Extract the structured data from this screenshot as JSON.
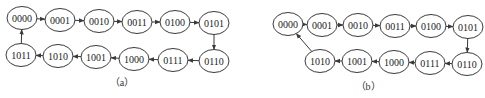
{
  "diagrams": [
    {
      "id": "a",
      "caption": "（a）",
      "caption_pos": [
        122,
        86
      ],
      "nodes": [
        {
          "label": "0000",
          "x": 22,
          "y": 18
        },
        {
          "label": "0001",
          "x": 60,
          "y": 20
        },
        {
          "label": "0010",
          "x": 99,
          "y": 21
        },
        {
          "label": "0011",
          "x": 137,
          "y": 22
        },
        {
          "label": "0100",
          "x": 175,
          "y": 22
        },
        {
          "label": "0101",
          "x": 214,
          "y": 23
        },
        {
          "label": "0110",
          "x": 214,
          "y": 61
        },
        {
          "label": "0111",
          "x": 173,
          "y": 60
        },
        {
          "label": "1000",
          "x": 134,
          "y": 59
        },
        {
          "label": "1001",
          "x": 96,
          "y": 57
        },
        {
          "label": "1010",
          "x": 58,
          "y": 56
        },
        {
          "label": "1011",
          "x": 21,
          "y": 55
        }
      ],
      "edges": [
        [
          0,
          1
        ],
        [
          1,
          2
        ],
        [
          2,
          3
        ],
        [
          3,
          4
        ],
        [
          4,
          5
        ],
        [
          5,
          6
        ],
        [
          6,
          7
        ],
        [
          7,
          8
        ],
        [
          8,
          9
        ],
        [
          9,
          10
        ],
        [
          10,
          11
        ],
        [
          11,
          0
        ]
      ]
    },
    {
      "id": "b",
      "caption": "（b）",
      "caption_pos": [
        368,
        90
      ],
      "nodes": [
        {
          "label": "0000",
          "x": 288,
          "y": 24
        },
        {
          "label": "0001",
          "x": 322,
          "y": 25
        },
        {
          "label": "0010",
          "x": 358,
          "y": 25
        },
        {
          "label": "0011",
          "x": 395,
          "y": 26
        },
        {
          "label": "0100",
          "x": 431,
          "y": 26
        },
        {
          "label": "0101",
          "x": 468,
          "y": 27
        },
        {
          "label": "0110",
          "x": 467,
          "y": 64
        },
        {
          "label": "0111",
          "x": 430,
          "y": 63
        },
        {
          "label": "1000",
          "x": 394,
          "y": 62
        },
        {
          "label": "1001",
          "x": 357,
          "y": 61
        },
        {
          "label": "1010",
          "x": 320,
          "y": 61
        }
      ],
      "edges": [
        [
          0,
          1
        ],
        [
          1,
          2
        ],
        [
          2,
          3
        ],
        [
          3,
          4
        ],
        [
          4,
          5
        ],
        [
          5,
          6
        ],
        [
          6,
          7
        ],
        [
          7,
          8
        ],
        [
          8,
          9
        ],
        [
          9,
          10
        ],
        [
          10,
          0
        ]
      ]
    }
  ],
  "style": {
    "stroke_color": "#3a3a3a",
    "node_rx": 15,
    "node_ry": 11.5
  }
}
